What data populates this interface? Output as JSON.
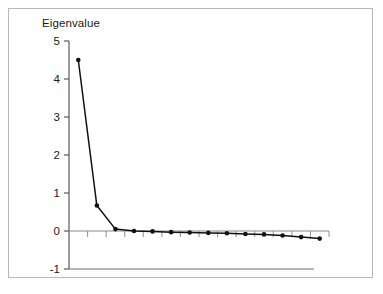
{
  "figure": {
    "background_color": "#ffffff",
    "frame_color": "#b9b9b9",
    "axis_color": "#595959",
    "line_color": "#111111",
    "marker_color": "#111111"
  },
  "chart_data": {
    "type": "line",
    "title": "Eigenvalue",
    "xlabel": "",
    "ylabel": "",
    "ylim": [
      -1,
      5
    ],
    "yticks": [
      -1,
      0,
      1,
      2,
      3,
      4,
      5
    ],
    "ytick_labels": [
      "-1",
      "0",
      "1",
      "2",
      "3",
      "4",
      "5"
    ],
    "xlim": [
      0.5,
      14.5
    ],
    "xticks": [
      1,
      2,
      3,
      4,
      5,
      6,
      7,
      8,
      9,
      10,
      11,
      12,
      13,
      14
    ],
    "xtick_labels": [
      "",
      "",
      "",
      "",
      "",
      "",
      "",
      "",
      "",
      "",
      "",
      "",
      "",
      ""
    ],
    "grid": false,
    "legend": null,
    "markers": "filled-circle",
    "zero_line": true,
    "series": [
      {
        "name": "Eigenvalue",
        "x": [
          1,
          2,
          3,
          4,
          5,
          6,
          7,
          8,
          9,
          10,
          11,
          12,
          13,
          14
        ],
        "values": [
          4.5,
          0.67,
          0.05,
          0.0,
          -0.01,
          -0.03,
          -0.04,
          -0.05,
          -0.06,
          -0.08,
          -0.09,
          -0.12,
          -0.16,
          -0.2
        ]
      }
    ]
  }
}
